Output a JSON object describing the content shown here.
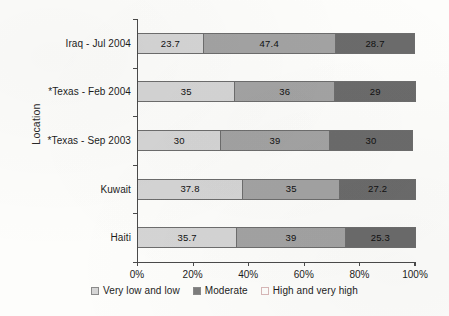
{
  "chart_data": {
    "type": "bar",
    "orientation": "horizontal",
    "stacked": true,
    "stack_mode": "percent",
    "title": "",
    "xlabel": "",
    "ylabel": "Location",
    "xlim": [
      0,
      100
    ],
    "xticks": [
      "0%",
      "20%",
      "40%",
      "60%",
      "80%",
      "100%"
    ],
    "xtick_values": [
      0,
      20,
      40,
      60,
      80,
      100
    ],
    "grid": false,
    "legend_position": "bottom",
    "categories": [
      "Iraq - Jul 2004",
      "*Texas - Feb 2004",
      "*Texas - Sep 2003",
      "Kuwait",
      "Haiti"
    ],
    "series": [
      {
        "name": "Very low and low",
        "color": "#d5d5d5",
        "values": [
          23.7,
          35,
          30,
          37.8,
          35.7
        ],
        "labels": [
          "23.7",
          "35",
          "30",
          "37.8",
          "35.7"
        ]
      },
      {
        "name": "Moderate",
        "color": "#a3a3a3",
        "values": [
          47.4,
          36,
          39,
          35,
          39
        ],
        "labels": [
          "47.4",
          "36",
          "39",
          "35",
          "39"
        ]
      },
      {
        "name": "High and very high",
        "color": "#6b6b6b",
        "values": [
          28.7,
          29,
          30,
          27.2,
          25.3
        ],
        "labels": [
          "28.7",
          "29",
          "30",
          "27.2",
          "25.3"
        ]
      }
    ],
    "legend_swatch_colors": [
      "#d5d5d5",
      "#7d7d7d",
      "#fdfdfb"
    ]
  },
  "axis": {
    "y_title": "Location"
  }
}
